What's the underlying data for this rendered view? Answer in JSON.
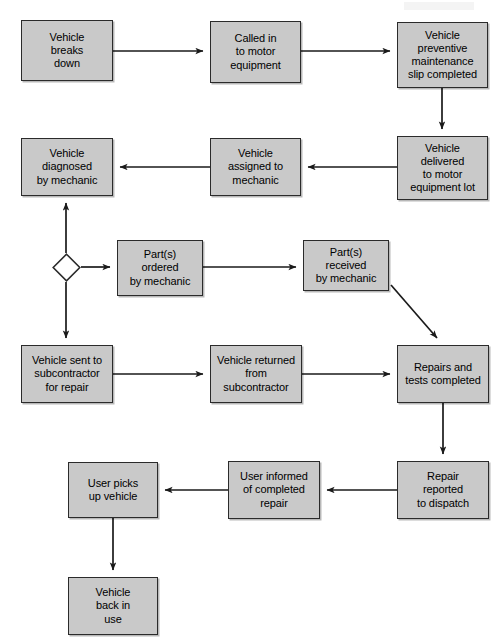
{
  "diagram": {
    "type": "flowchart",
    "canvas": {
      "width": 502,
      "height": 643
    },
    "style": {
      "node_fill": "#c9c9c9",
      "node_border": "#2b2b2b",
      "edge_color": "#1a1a1a",
      "background": "#ffffff",
      "decision_fill": "#ffffff"
    },
    "nodes": [
      {
        "id": "n1",
        "shape": "process",
        "text": "Vehicle\nbreaks\ndown",
        "x": 21,
        "y": 20,
        "w": 92,
        "h": 61
      },
      {
        "id": "n2",
        "shape": "process",
        "text": "Called in\nto motor\nequipment",
        "x": 210,
        "y": 21,
        "w": 91,
        "h": 62
      },
      {
        "id": "n3",
        "shape": "process",
        "text": "Vehicle\npreventive\nmaintenance\nslip completed",
        "x": 397,
        "y": 22,
        "w": 91,
        "h": 66
      },
      {
        "id": "n4",
        "shape": "process",
        "text": "Vehicle\ndelivered\nto motor\nequipment lot",
        "x": 397,
        "y": 136,
        "w": 91,
        "h": 64
      },
      {
        "id": "n5",
        "shape": "process",
        "text": "Vehicle\nassigned to\nmechanic",
        "x": 210,
        "y": 138,
        "w": 91,
        "h": 58
      },
      {
        "id": "n6",
        "shape": "process",
        "text": "Vehicle\ndiagnosed\nby mechanic",
        "x": 21,
        "y": 138,
        "w": 92,
        "h": 58
      },
      {
        "id": "n7",
        "shape": "decision",
        "text": "",
        "x": 52,
        "y": 253,
        "w": 29,
        "h": 29
      },
      {
        "id": "n8",
        "shape": "process",
        "text": "Part(s)\nordered\nby mechanic",
        "x": 117,
        "y": 240,
        "w": 86,
        "h": 56
      },
      {
        "id": "n9",
        "shape": "process",
        "text": "Part(s)\nreceived\nby mechanic",
        "x": 303,
        "y": 240,
        "w": 86,
        "h": 51
      },
      {
        "id": "n10",
        "shape": "process",
        "text": "Vehicle sent to\nsubcontractor\nfor repair",
        "x": 21,
        "y": 345,
        "w": 92,
        "h": 58
      },
      {
        "id": "n11",
        "shape": "process",
        "text": "Vehicle returned\nfrom\nsubcontractor",
        "x": 210,
        "y": 345,
        "w": 92,
        "h": 58
      },
      {
        "id": "n12",
        "shape": "process",
        "text": "Repairs and\ntests completed",
        "x": 397,
        "y": 345,
        "w": 92,
        "h": 58
      },
      {
        "id": "n13",
        "shape": "process",
        "text": "Repair\nreported\nto dispatch",
        "x": 397,
        "y": 461,
        "w": 92,
        "h": 58
      },
      {
        "id": "n14",
        "shape": "process",
        "text": "User informed\nof completed\nrepair",
        "x": 228,
        "y": 461,
        "w": 92,
        "h": 58
      },
      {
        "id": "n15",
        "shape": "process",
        "text": "User picks\nup vehicle",
        "x": 68,
        "y": 462,
        "w": 90,
        "h": 56
      },
      {
        "id": "n16",
        "shape": "process",
        "text": "Vehicle\nback in\nuse",
        "x": 68,
        "y": 577,
        "w": 90,
        "h": 58
      }
    ],
    "edges": [
      {
        "id": "e1",
        "from": "n1",
        "to": "n2",
        "path": "M113,51 L203,51",
        "arrow": "end"
      },
      {
        "id": "e2",
        "from": "n2",
        "to": "n3",
        "path": "M301,51 L390,51",
        "arrow": "end"
      },
      {
        "id": "e3",
        "from": "n3",
        "to": "n4",
        "path": "M442,88 L442,129",
        "arrow": "end"
      },
      {
        "id": "e4",
        "from": "n4",
        "to": "n5",
        "path": "M397,167 L308,167",
        "arrow": "end"
      },
      {
        "id": "e5",
        "from": "n5",
        "to": "n6",
        "path": "M210,167 L120,167",
        "arrow": "end"
      },
      {
        "id": "e6",
        "from": "n7",
        "to": "n6",
        "path": "M66,253 L66,203",
        "arrow": "end"
      },
      {
        "id": "e7",
        "from": "n7",
        "to": "n8",
        "path": "M81,267 L110,267",
        "arrow": "end"
      },
      {
        "id": "e8",
        "from": "n7",
        "to": "n10",
        "path": "M66,282 L66,338",
        "arrow": "end"
      },
      {
        "id": "e9",
        "from": "n8",
        "to": "n9",
        "path": "M203,267 L296,267",
        "arrow": "end"
      },
      {
        "id": "e10",
        "from": "n9",
        "to": "n12",
        "path": "M391,285 L437,338",
        "arrow": "end"
      },
      {
        "id": "e11",
        "from": "n10",
        "to": "n11",
        "path": "M113,374 L203,374",
        "arrow": "end"
      },
      {
        "id": "e12",
        "from": "n11",
        "to": "n12",
        "path": "M302,374 L390,374",
        "arrow": "end"
      },
      {
        "id": "e13",
        "from": "n12",
        "to": "n13",
        "path": "M443,403 L443,454",
        "arrow": "end"
      },
      {
        "id": "e14",
        "from": "n13",
        "to": "n14",
        "path": "M397,490 L327,490",
        "arrow": "end"
      },
      {
        "id": "e15",
        "from": "n14",
        "to": "n15",
        "path": "M228,490 L165,490",
        "arrow": "end"
      },
      {
        "id": "e16",
        "from": "n15",
        "to": "n16",
        "path": "M113,518 L113,570",
        "arrow": "end"
      }
    ]
  }
}
